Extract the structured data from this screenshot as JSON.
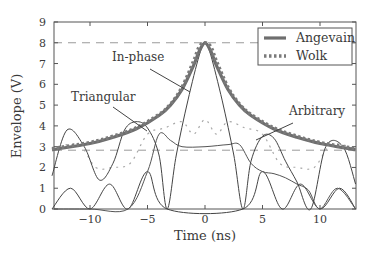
{
  "chart_data": {
    "type": "line",
    "title": "",
    "xlabel": "Time (ns)",
    "ylabel": "Envelope (V)",
    "xlim": [
      -13.3,
      13.1
    ],
    "ylim": [
      0,
      9
    ],
    "xticks": [
      -10,
      -5,
      0,
      5,
      10
    ],
    "xtick_labels": [
      "−10",
      "−5",
      "0",
      "5",
      "10"
    ],
    "yticks": [
      0,
      1,
      2,
      3,
      4,
      5,
      6,
      7,
      8,
      9
    ],
    "ytick_labels": [
      "0",
      "1",
      "2",
      "3",
      "4",
      "5",
      "6",
      "7",
      "8",
      "9"
    ],
    "grid": false,
    "reference_lines": [
      {
        "orientation": "horizontal",
        "y": 8.0,
        "style": "dashed"
      },
      {
        "orientation": "horizontal",
        "y": 2.83,
        "style": "dashed"
      }
    ],
    "legend": {
      "position": "upper right",
      "entries": [
        {
          "label": "Angevain",
          "style": "thick-solid",
          "color": "#6e6e6e"
        },
        {
          "label": "Wolk",
          "style": "thick-dotted",
          "color": "#7a7a7a"
        }
      ]
    },
    "annotations": [
      {
        "text": "In-phase",
        "x": -6.0,
        "y": 7.0,
        "arrow_to": [
          -1.4,
          5.7
        ]
      },
      {
        "text": "Triangular",
        "x": -8.0,
        "y": 5.1,
        "arrow_to": [
          -4.6,
          3.6
        ]
      },
      {
        "text": "Arbitrary",
        "x": 10.0,
        "y": 4.4,
        "arrow_to": [
          5.8,
          3.4
        ]
      }
    ],
    "series": [
      {
        "name": "Angevain",
        "style": "thick-solid",
        "x": [
          -13.3,
          -10,
          -8,
          -6,
          -4,
          -3,
          -2,
          -1,
          -0.5,
          0,
          0.5,
          1,
          2,
          3,
          4,
          6,
          8,
          10,
          13.1
        ],
        "y": [
          2.85,
          3.15,
          3.45,
          3.85,
          4.5,
          5.0,
          5.75,
          6.9,
          7.6,
          8.0,
          7.6,
          6.9,
          5.75,
          5.0,
          4.5,
          3.85,
          3.45,
          3.15,
          2.85
        ]
      },
      {
        "name": "Wolk",
        "style": "thick-dotted",
        "x": [
          -13.3,
          -10,
          -8,
          -6,
          -4,
          -3,
          -2,
          -1,
          -0.5,
          0,
          0.5,
          1,
          2,
          3,
          4,
          6,
          8,
          10,
          13.1
        ],
        "y": [
          2.9,
          3.2,
          3.5,
          3.9,
          4.55,
          5.05,
          5.85,
          7.1,
          7.8,
          8.0,
          7.8,
          7.1,
          5.85,
          5.05,
          4.55,
          3.9,
          3.5,
          3.2,
          2.9
        ]
      },
      {
        "name": "In-phase",
        "style": "thin-solid",
        "x": [
          -13.3,
          -12,
          -10.5,
          -9.2,
          -8,
          -7,
          -6,
          -5,
          -4,
          -3.3,
          -2.5,
          -1.5,
          -0.5,
          0,
          0.5,
          1.5,
          2.5,
          3.3,
          4,
          5,
          6,
          7,
          8,
          9.2,
          10.5,
          12,
          13.1
        ],
        "y": [
          1.6,
          3.8,
          3.0,
          1.4,
          2.2,
          3.8,
          4.2,
          3.9,
          2.6,
          0.0,
          2.6,
          5.2,
          7.4,
          8.0,
          7.4,
          5.2,
          2.6,
          0.0,
          2.3,
          3.5,
          3.4,
          2.3,
          1.3,
          0.0,
          3.0,
          3.0,
          1.2
        ]
      },
      {
        "name": "Triangular",
        "style": "thin-dotted",
        "x": [
          -13.3,
          -11,
          -9.5,
          -8,
          -6.5,
          -5,
          -3.5,
          -2,
          -1,
          0,
          1,
          2,
          3.5,
          5,
          6.5,
          8,
          9.5,
          11,
          13.1
        ],
        "y": [
          2.9,
          3.1,
          2.0,
          2.0,
          2.2,
          3.6,
          3.9,
          4.2,
          3.6,
          4.3,
          3.6,
          4.2,
          3.9,
          3.6,
          2.2,
          2.0,
          2.0,
          3.1,
          2.9
        ]
      },
      {
        "name": "Arbitrary",
        "style": "thin-solid",
        "x": [
          -13.3,
          -10,
          -6.7,
          -5,
          -4,
          -3,
          -2,
          0,
          2,
          3,
          4,
          5,
          6,
          7,
          8,
          9,
          10,
          11.5,
          13.1
        ],
        "y": [
          0.0,
          0.0,
          0.0,
          1.8,
          3.6,
          3.3,
          3.0,
          3.0,
          3.1,
          3.1,
          2.2,
          1.8,
          1.7,
          1.5,
          1.2,
          0.9,
          0.0,
          1.0,
          0.0
        ]
      },
      {
        "name": "Lower lobes",
        "style": "thin-solid",
        "x": [
          -13.3,
          -11.7,
          -10,
          -8.3,
          -6.7,
          -5,
          -3.3,
          3.3,
          5,
          6.7,
          8.3,
          10,
          11.7,
          13.1
        ],
        "y": [
          0.0,
          1.0,
          0.0,
          1.2,
          0.0,
          1.8,
          0.0,
          0.0,
          1.8,
          0.0,
          1.2,
          0.0,
          1.0,
          0.0
        ]
      }
    ]
  },
  "axes": {
    "xlabel": "Time (ns)",
    "ylabel": "Envelope (V)",
    "xtick_labels": [
      "−10",
      "−5",
      "0",
      "5",
      "10"
    ],
    "ytick_labels": [
      "0",
      "1",
      "2",
      "3",
      "4",
      "5",
      "6",
      "7",
      "8",
      "9"
    ]
  },
  "legend": {
    "entries": [
      {
        "label": "Angevain"
      },
      {
        "label": "Wolk"
      }
    ]
  },
  "annotations": {
    "in_phase": "In-phase",
    "triangular": "Triangular",
    "arbitrary": "Arbitrary"
  },
  "colors": {
    "ink": "#3a3a3a",
    "envelope": "#6e6e6e",
    "dashed": "#9a9a9a",
    "dotted_light": "#a8a8a8"
  }
}
